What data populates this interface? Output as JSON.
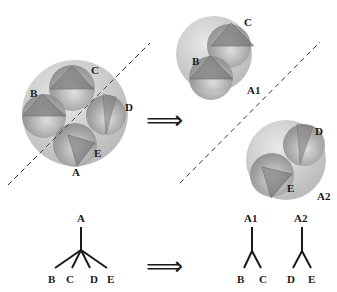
{
  "left_cluster": {
    "labels": {
      "A": "A",
      "B": "B",
      "C": "C",
      "D": "D",
      "E": "E"
    }
  },
  "right_clusters": {
    "a1": {
      "name": "A1",
      "children": {
        "B": "B",
        "C": "C"
      }
    },
    "a2": {
      "name": "A2",
      "children": {
        "D": "D",
        "E": "E"
      }
    }
  },
  "arrow_symbol": "⟹",
  "tree_before": {
    "root": "A",
    "leaves": [
      "B",
      "C",
      "D",
      "E"
    ]
  },
  "tree_after": [
    {
      "root": "A1",
      "leaves": [
        "B",
        "C"
      ]
    },
    {
      "root": "A2",
      "leaves": [
        "D",
        "E"
      ]
    }
  ],
  "colors": {
    "outer_sphere": "#c8c8c8",
    "inner_sphere": "#a8a8a8",
    "line": "#1a1a1a",
    "dashed": "#333333"
  }
}
